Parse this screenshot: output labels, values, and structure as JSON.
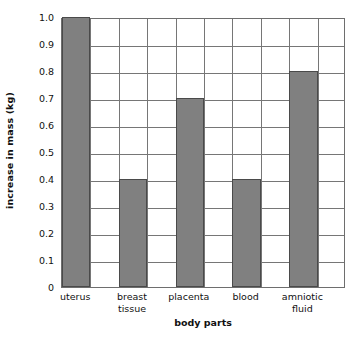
{
  "chart_data": {
    "type": "bar",
    "title": "",
    "xlabel": "body parts",
    "ylabel": "increase in mass (kg)",
    "categories": [
      "uterus",
      "breast tissue",
      "placenta",
      "blood",
      "amniotic fluid"
    ],
    "values": [
      1.0,
      0.4,
      0.7,
      0.4,
      0.8
    ],
    "ylim": [
      0,
      1.0
    ],
    "ytick_labels": [
      "1.0",
      "0.9",
      "0.8",
      "0.7",
      "0.6",
      "0.5",
      "0.4",
      "0.3",
      "0.2",
      "0.1",
      "0"
    ],
    "ytick_values": [
      1.0,
      0.9,
      0.8,
      0.7,
      0.6,
      0.5,
      0.4,
      0.3,
      0.2,
      0.1,
      0
    ],
    "grid": "both",
    "legend": "none",
    "bar_color": "#808080",
    "bar_edge_color": "#4a4a4a",
    "grid_color": "#767676",
    "axis_color": "#6e6e6e",
    "background": "#ffffff",
    "n_columns": 10,
    "bar_columns": [
      0,
      2,
      4,
      6,
      8
    ],
    "category_label_lines": [
      [
        "uterus"
      ],
      [
        "breast",
        "tissue"
      ],
      [
        "placenta"
      ],
      [
        "blood"
      ],
      [
        "amniotic",
        "fluid"
      ]
    ]
  }
}
